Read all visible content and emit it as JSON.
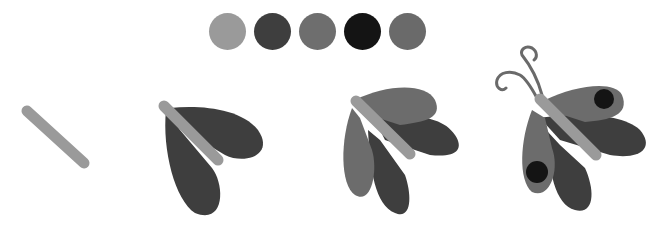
{
  "palette": {
    "swatches": [
      {
        "name": "light-gray",
        "color": "#9a9a9a"
      },
      {
        "name": "dark-gray",
        "color": "#3e3e3e"
      },
      {
        "name": "mid-gray",
        "color": "#6e6e6e"
      },
      {
        "name": "black",
        "color": "#141414"
      },
      {
        "name": "mid-gray-2",
        "color": "#6a6a6a"
      }
    ]
  },
  "colors": {
    "body": "#9a9a9a",
    "wing_dark": "#3e3e3e",
    "wing_mid": "#6c6c6c",
    "spot": "#141414",
    "antenna": "#6a6a6a"
  },
  "stages": [
    {
      "step": 1,
      "description": "body"
    },
    {
      "step": 2,
      "description": "body with dark wings"
    },
    {
      "step": 3,
      "description": "body with dark and mid wings"
    },
    {
      "step": 4,
      "description": "complete butterfly with antennae and spots"
    }
  ]
}
